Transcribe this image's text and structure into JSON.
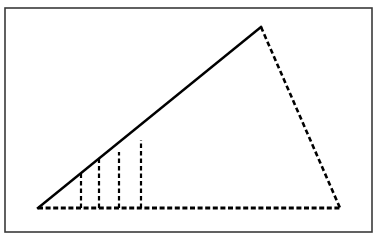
{
  "figure": {
    "canvas": {
      "width": 381,
      "height": 240,
      "background": "#ffffff"
    },
    "frame": {
      "name": "figure-border",
      "x": 5,
      "y": 8,
      "width": 367,
      "height": 224,
      "stroke": "#3a3a3a",
      "stroke_width": 1.6,
      "fill": "#ffffff"
    },
    "triangle": {
      "vertices": {
        "bottom_left": {
          "x": 38,
          "y": 208
        },
        "apex": {
          "x": 261,
          "y": 27
        },
        "bottom_right": {
          "x": 340,
          "y": 208
        }
      },
      "sides": [
        {
          "name": "hypotenuse-solid",
          "style": "solid",
          "stroke": "#000000",
          "stroke_width": 2.4,
          "from": {
            "x": 38,
            "y": 208
          },
          "to": {
            "x": 261,
            "y": 27
          }
        },
        {
          "name": "right-side-dashed",
          "style": "dashed",
          "stroke": "#000000",
          "stroke_width": 2.6,
          "dash": "5,3",
          "from": {
            "x": 261,
            "y": 27
          },
          "to": {
            "x": 340,
            "y": 208
          }
        },
        {
          "name": "base-dashed",
          "style": "dashed",
          "stroke": "#000000",
          "stroke_width": 2.8,
          "dash": "5,2.6",
          "from": {
            "x": 38,
            "y": 208
          },
          "to": {
            "x": 340,
            "y": 208
          }
        }
      ]
    },
    "vertical_segments": {
      "style": "dashed",
      "stroke": "#000000",
      "stroke_width": 2.2,
      "dash": "4.5,3",
      "baseline_y": 208,
      "items": [
        {
          "name": "vertical-dashed-1",
          "x": 81,
          "top_y": 173
        },
        {
          "name": "vertical-dashed-2",
          "x": 99,
          "top_y": 159
        },
        {
          "name": "vertical-dashed-3",
          "x": 119,
          "top_y": 152
        },
        {
          "name": "vertical-dashed-4",
          "x": 141,
          "top_y": 140
        }
      ]
    }
  },
  "chart_data": {
    "type": "line",
    "xlabel": "",
    "ylabel": "",
    "xlim": [
      38,
      340
    ],
    "ylim": [
      27,
      208
    ],
    "grid": false,
    "legend": "none",
    "series": [
      {
        "name": "hypotenuse (solid)",
        "style": "solid",
        "x": [
          38,
          261
        ],
        "y": [
          208,
          27
        ]
      },
      {
        "name": "right side (dashed)",
        "style": "dashed",
        "x": [
          261,
          340
        ],
        "y": [
          27,
          208
        ]
      },
      {
        "name": "base (dashed)",
        "style": "dashed",
        "x": [
          38,
          340
        ],
        "y": [
          208,
          208
        ]
      },
      {
        "name": "vertical ordinate 1 (dashed)",
        "style": "dashed",
        "x": [
          81,
          81
        ],
        "y": [
          208,
          173
        ]
      },
      {
        "name": "vertical ordinate 2 (dashed)",
        "style": "dashed",
        "x": [
          99,
          99
        ],
        "y": [
          208,
          159
        ]
      },
      {
        "name": "vertical ordinate 3 (dashed)",
        "style": "dashed",
        "x": [
          119,
          119
        ],
        "y": [
          208,
          152
        ]
      },
      {
        "name": "vertical ordinate 4 (dashed)",
        "style": "dashed",
        "x": [
          141,
          141
        ],
        "y": [
          208,
          140
        ]
      }
    ],
    "annotations": []
  }
}
